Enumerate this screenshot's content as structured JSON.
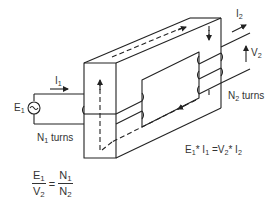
{
  "diagram": {
    "colors": {
      "line": "#222222",
      "text": "#333333",
      "background": "#ffffff"
    },
    "labels": {
      "i1": {
        "main": "I",
        "sub": "1"
      },
      "i2": {
        "main": "I",
        "sub": "2"
      },
      "e1": {
        "main": "E",
        "sub": "1"
      },
      "v2": {
        "main": "V",
        "sub": "2"
      },
      "n1_turns": {
        "main": "N",
        "sub": "1",
        "suffix": " turns"
      },
      "n2_turns": {
        "main": "N",
        "sub": "2",
        "suffix": " turns"
      }
    },
    "power_equation": {
      "text_parts": [
        "E",
        "1",
        "* I",
        "1",
        " =V",
        "2",
        "* I",
        "2"
      ]
    },
    "ratio_equation": {
      "lhs_num": {
        "main": "E",
        "sub": "1"
      },
      "lhs_den": {
        "main": "V",
        "sub": "2"
      },
      "equals": "=",
      "rhs_num": {
        "main": "N",
        "sub": "1"
      },
      "rhs_den": {
        "main": "N",
        "sub": "2"
      }
    },
    "source_symbol": "~",
    "components": [
      "magnetic-core",
      "primary-winding",
      "secondary-winding",
      "ac-source",
      "flux-path",
      "current-arrows",
      "voltage-arrow"
    ]
  }
}
